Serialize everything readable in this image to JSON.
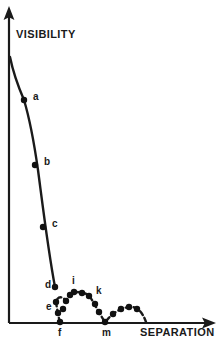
{
  "figure": {
    "name": "visibility-vs-separation-plot",
    "background_color": "#ffffff",
    "ink_color": "#1a1a1a"
  },
  "axes": {
    "y_axis": {
      "label": "VISIBILITY",
      "label_x": 16,
      "label_y": 38,
      "line_x": 9,
      "line_top": 16,
      "line_bottom": 323,
      "arrow": "up-arrow-icon"
    },
    "x_axis": {
      "label": "SEPARATION",
      "label_x": 140,
      "label_y": 334,
      "line_y": 323,
      "line_left": 9,
      "line_right": 206,
      "arrow": "right-arrow-icon"
    }
  },
  "chart_data": {
    "type": "scatter",
    "title": "",
    "xlabel": "SEPARATION",
    "ylabel": "VISIBILITY",
    "grid": false,
    "legend": "none",
    "axis_units": "arbitrary (unlabeled qualitative axes)",
    "xlim": [
      0,
      206
    ],
    "ylim": [
      0,
      323
    ],
    "labeled_points": [
      {
        "label": "a",
        "x": 24,
        "y": 100,
        "label_x": 33,
        "label_y": 100,
        "label_side": "right"
      },
      {
        "label": "b",
        "x": 35,
        "y": 165,
        "label_x": 44,
        "label_y": 165,
        "label_side": "right"
      },
      {
        "label": "c",
        "x": 43,
        "y": 227,
        "label_x": 52,
        "label_y": 227,
        "label_side": "right"
      },
      {
        "label": "d",
        "x": 55,
        "y": 287,
        "label_x": 45,
        "label_y": 288,
        "label_side": "left"
      },
      {
        "label": "e",
        "x": 56,
        "y": 302,
        "label_x": 46,
        "label_y": 310,
        "label_side": "left"
      },
      {
        "label": "f",
        "x": 60,
        "y": 322,
        "label_x": 58,
        "label_y": 336,
        "label_side": "below"
      },
      {
        "label": "i",
        "x": 74,
        "y": 292,
        "label_x": 72,
        "label_y": 284,
        "label_side": "above"
      },
      {
        "label": "k",
        "x": 89,
        "y": 296,
        "label_x": 96,
        "label_y": 294,
        "label_side": "right"
      },
      {
        "label": "m",
        "x": 105,
        "y": 322,
        "label_x": 102,
        "label_y": 336,
        "label_side": "below"
      }
    ],
    "unlabeled_points": [
      {
        "x": 58,
        "y": 313
      },
      {
        "x": 63,
        "y": 309
      },
      {
        "x": 66,
        "y": 301
      },
      {
        "x": 70,
        "y": 295
      },
      {
        "x": 82,
        "y": 293
      },
      {
        "x": 95,
        "y": 304
      },
      {
        "x": 99,
        "y": 312
      },
      {
        "x": 113,
        "y": 314
      },
      {
        "x": 121,
        "y": 309
      },
      {
        "x": 129,
        "y": 307
      },
      {
        "x": 137,
        "y": 309
      }
    ],
    "decay_curve_path": "M 10,57 C 13,72 18,86 24,100 C 30,120 34,142 38,170 C 42,200 48,250 55,287",
    "revival_curve_path": "M 60,322 C 58,316 57,308 56,302 C 57,297 62,295 66,301 C 69,296 71,293 74,292 C 78,292 80,292 82,293 C 85,293 87,294 89,296 C 93,300 97,310 105,322 C 109,318 111,315 113,314 C 118,310 124,307 131,307 C 137,307 142,311 146,322",
    "point_radius": 3.2
  }
}
